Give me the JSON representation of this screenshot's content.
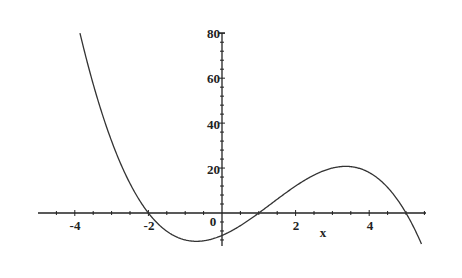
{
  "chart_data": {
    "type": "line",
    "title": "",
    "xlabel": "x",
    "ylabel": "",
    "function": "-(x+2)(x-1)(x-5)",
    "xlim": [
      -4.9,
      5.5
    ],
    "ylim": [
      -12,
      80
    ],
    "x_ticks": [
      -4,
      -2,
      0,
      2,
      4
    ],
    "y_ticks": [
      20,
      40,
      60,
      80
    ],
    "x_tick_labels": [
      "-4",
      "-2",
      "0",
      "2",
      "4"
    ],
    "y_tick_labels": [
      "20",
      "40",
      "60",
      "80"
    ],
    "grid": false,
    "legend": null,
    "series": [
      {
        "name": "f(x)",
        "x": [
          -3.86,
          -3.5,
          -3,
          -2.5,
          -2,
          -1.5,
          -1,
          -0.5,
          0,
          0.5,
          1,
          1.5,
          2,
          2.5,
          3,
          3.5,
          4,
          4.5,
          5,
          5.4
        ],
        "values": [
          80.1,
          57.4,
          32,
          14.6,
          0,
          -6.9,
          -12,
          -12.4,
          -10,
          -6.3,
          0,
          6.1,
          12,
          16.9,
          20,
          20.6,
          18,
          11.4,
          0,
          -11.0
        ]
      }
    ],
    "roots": [
      -2,
      1,
      5
    ],
    "local_min": {
      "x": -0.56,
      "y": -12.6
    },
    "local_max": {
      "x": 3.23,
      "y": 20.7
    },
    "y_intercept": -10
  },
  "labels": {
    "x_axis": "x",
    "x_ticks": {
      "m4": "-4",
      "m2": "-2",
      "z": "0",
      "p2": "2",
      "p4": "4"
    },
    "y_ticks": {
      "y20": "20",
      "y40": "40",
      "y60": "60",
      "y80": "80"
    }
  },
  "colors": {
    "curve": "#333333",
    "axis": "#222222",
    "background": "#ffffff"
  }
}
